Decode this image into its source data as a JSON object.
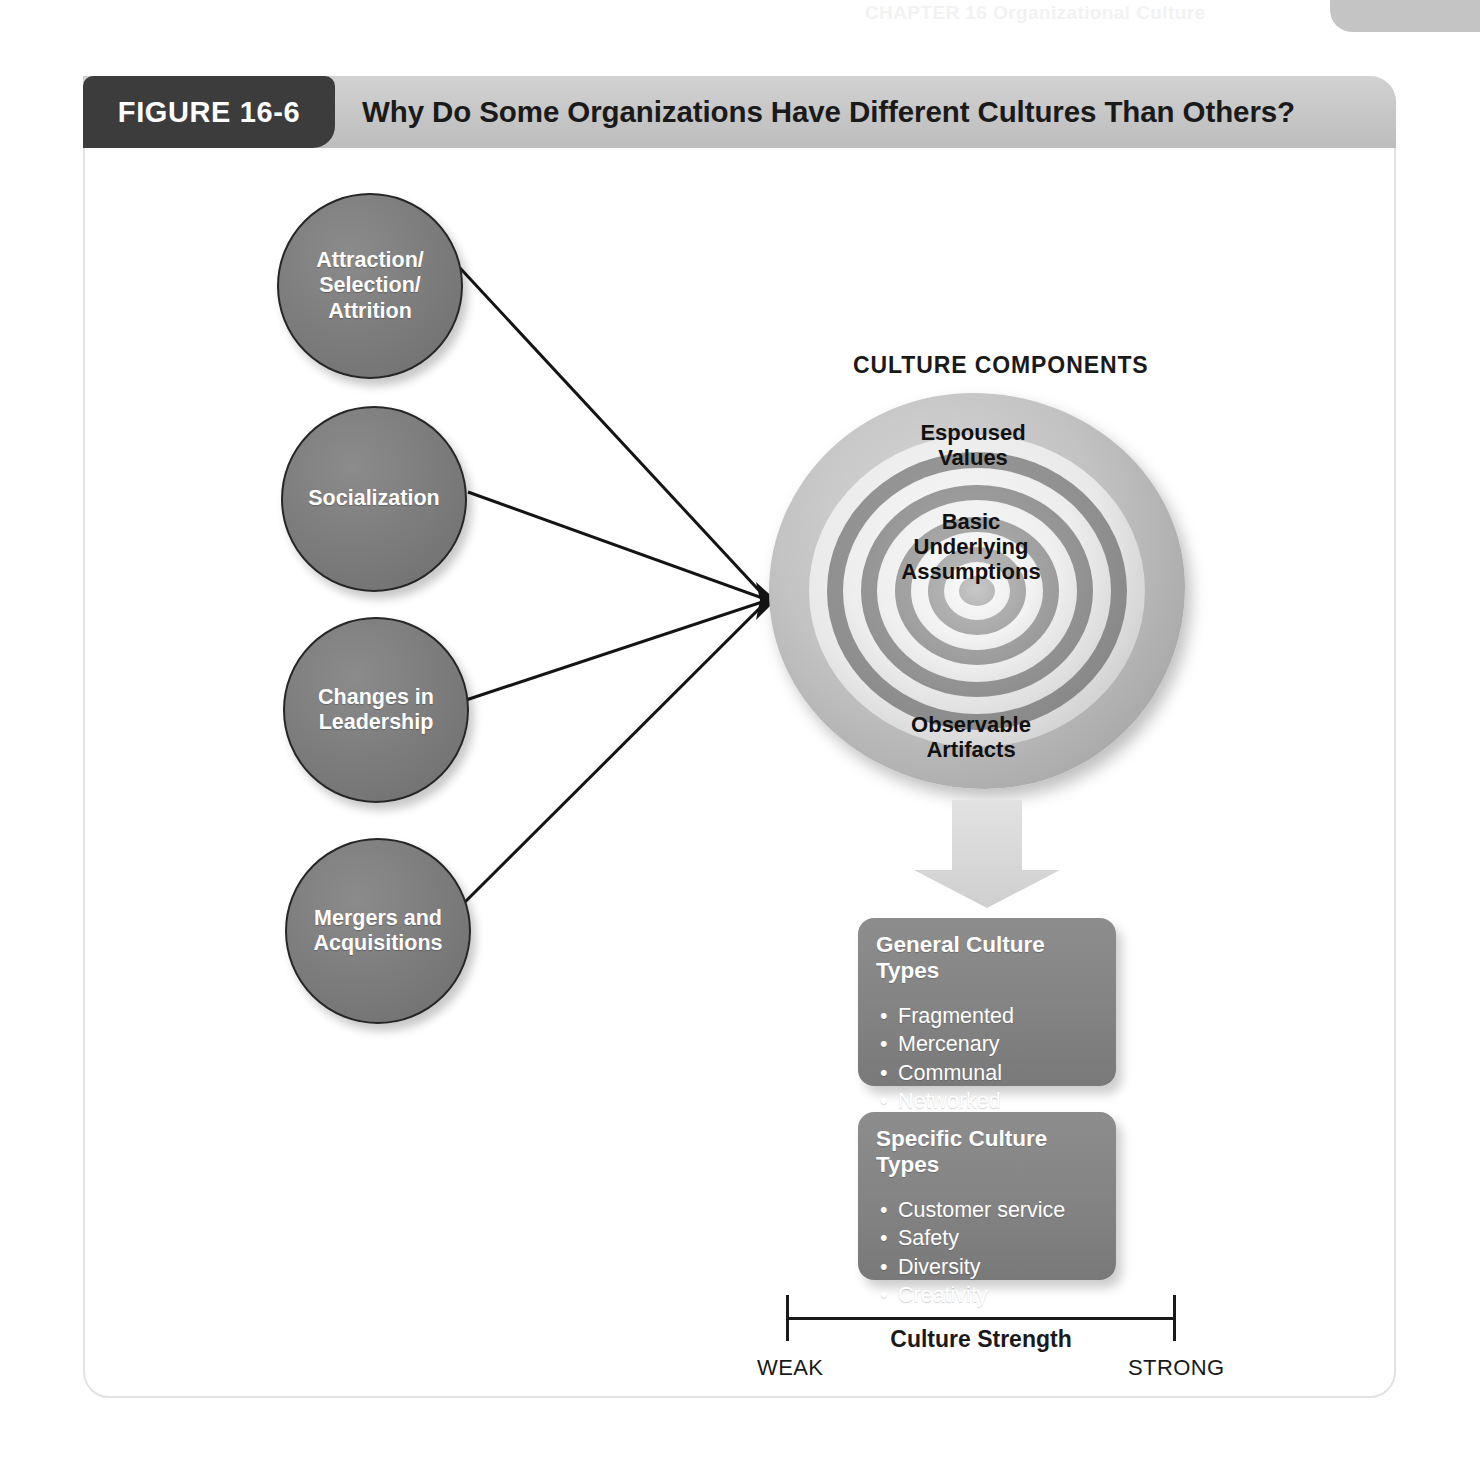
{
  "page": {
    "running_head": "CHAPTER 16  Organizational Culture"
  },
  "figure": {
    "tab_label": "FIGURE 16-6",
    "title": "Why Do Some Organizations Have Different Cultures Than Others?"
  },
  "drivers": [
    {
      "id": "asa",
      "label": "Attraction/\nSelection/\nAttrition"
    },
    {
      "id": "social",
      "label": "Socialization"
    },
    {
      "id": "leader",
      "label": "Changes in\nLeadership"
    },
    {
      "id": "merger",
      "label": "Mergers and\nAcquisitions"
    }
  ],
  "culture_components": {
    "heading": "CULTURE COMPONENTS",
    "layers": [
      {
        "id": "espoused",
        "label": "Espoused\nValues"
      },
      {
        "id": "basic",
        "label": "Basic\nUnderlying\nAssumptions"
      },
      {
        "id": "observable",
        "label": "Observable\nArtifacts"
      }
    ]
  },
  "boxes": [
    {
      "id": "general",
      "title": "General Culture Types",
      "items": [
        "Fragmented",
        "Mercenary",
        "Communal",
        "Networked"
      ]
    },
    {
      "id": "specific",
      "title": "Specific Culture Types",
      "items": [
        "Customer service",
        "Safety",
        "Diversity",
        "Creativity"
      ]
    }
  ],
  "scale": {
    "label": "Culture Strength",
    "left": "WEAK",
    "right": "STRONG"
  },
  "colors": {
    "tab_bg": "#3c3c3c",
    "header_bg": "#c6c6c6",
    "circle_fill": "#7b7b7b",
    "box_fill": "#848484",
    "text_dark": "#1a1a1a",
    "text_light": "#ffffff",
    "frame_border": "#e3e3e3"
  }
}
